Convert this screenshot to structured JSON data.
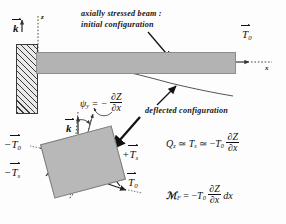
{
  "figure": {
    "title_annotation_line1": "axially stressed beam :",
    "title_annotation_line2": "initial configuration",
    "deflected_annotation": "deflected configuration"
  },
  "upper_diagram": {
    "axis_z_label": "z",
    "axis_x_label": "x",
    "unit_vector_k": "k",
    "end_force_label": "T",
    "end_force_sub": "0"
  },
  "slope_equation": {
    "symbol": "ψ",
    "symbol_sub": "y",
    "equals": "= −",
    "numerator": "∂Z",
    "denominator": "∂x"
  },
  "lower_diagram": {
    "unit_vector_k": "k",
    "label_minus_T0_main": "T",
    "label_minus_T0_sub": "0",
    "label_minus_T0_sign": "−",
    "label_minus_Ts_main": "T",
    "label_minus_Ts_sub": "s",
    "label_minus_Ts_sign": "−",
    "label_plus_Ts_main": "T",
    "label_plus_Ts_sub": "s",
    "label_plus_Ts_sign": "+",
    "label_T0_main": "T",
    "label_T0_sub": "0"
  },
  "equations": {
    "shear": {
      "lhs_main": "Q",
      "lhs_sub": "z",
      "rel1": "≃",
      "mid_main": "T",
      "mid_sub": "s",
      "rel2": "≃ −",
      "coef_main": "T",
      "coef_sub": "0",
      "frac_num": "∂Z",
      "frac_den": "∂x"
    },
    "moment": {
      "lhs": "ℳ",
      "lhs_sub": "F",
      "rel": "= −",
      "coef_main": "T",
      "coef_sub": "0",
      "frac_num": "∂Z",
      "frac_den": "∂x",
      "tail": "dx"
    }
  },
  "colors": {
    "beam_fill": "#b3b3b3",
    "element_fill": "#b8b8b8",
    "wall_hatch": "#3a3a3a",
    "ink": "#111111",
    "background": "#fdfdfd"
  }
}
